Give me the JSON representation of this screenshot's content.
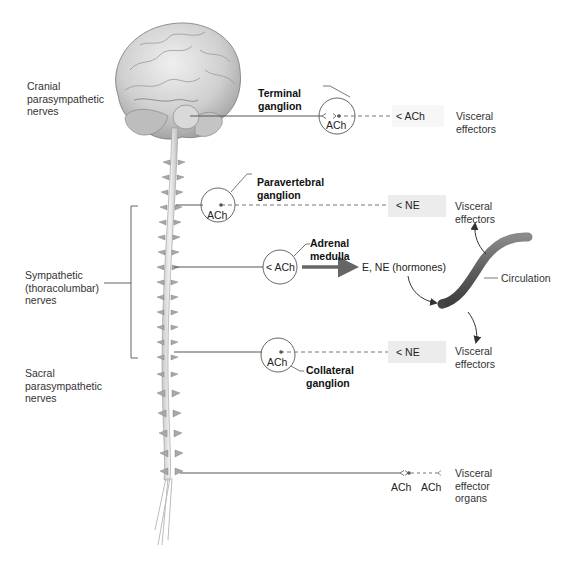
{
  "figure": {
    "colors": {
      "nerve_line": "#555555",
      "dashed_line": "#777777",
      "neurotransmitter_box": "#ececec",
      "blood_vessel": "#6b6b6b",
      "brain_fill": "#d6d6d6",
      "text": "#222222"
    }
  },
  "left_labels": {
    "cranial": [
      "Cranial",
      "parasympathetic",
      "nerves"
    ],
    "sympathetic": [
      "Sympathetic",
      "(thoracolumbar)",
      "nerves"
    ],
    "sacral": [
      "Sacral",
      "parasympathetic",
      "nerves"
    ]
  },
  "pathways": {
    "cranial": {
      "ganglion_label": [
        "Terminal",
        "ganglion"
      ],
      "ganglion_nt": "ACh",
      "target_nt": "ACh",
      "target": [
        "Visceral",
        "effectors"
      ]
    },
    "paravertebral": {
      "ganglion_label": [
        "Paravertebral",
        "ganglion"
      ],
      "ganglion_nt": "ACh",
      "target_nt": "NE",
      "target": [
        "Visceral",
        "effectors"
      ]
    },
    "adrenal": {
      "ganglion_label": [
        "Adrenal",
        "medulla"
      ],
      "ganglion_nt": "ACh",
      "output": "E, NE (hormones)",
      "vessel_label": "Circulation"
    },
    "collateral": {
      "ganglion_label": [
        "Collateral",
        "ganglion"
      ],
      "ganglion_nt": "ACh",
      "target_nt": "NE",
      "target": [
        "Visceral",
        "effectors"
      ]
    },
    "sacral": {
      "ganglion_nt": "ACh",
      "target_nt": "ACh",
      "target": [
        "Visceral",
        "effector",
        "organs"
      ]
    }
  }
}
